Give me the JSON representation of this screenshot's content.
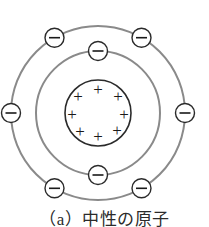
{
  "figure": {
    "caption": "（a）中性の原子",
    "colors": {
      "background": "#ffffff",
      "orbit_stroke": "#8a8a8a",
      "nucleus_stroke": "#1a1a1a",
      "electron_stroke": "#1a1a1a",
      "charge_symbol": "#1a1a1a",
      "caption_text": "#2b2b2b"
    },
    "geometry": {
      "center_x": 98,
      "center_y": 113,
      "outer_orbit_radius": 87,
      "inner_orbit_radius": 62,
      "nucleus_radius": 33,
      "electron_radius": 9.5
    },
    "nucleus": {
      "label": "nucleus",
      "charge_symbol": "+",
      "proton_count": 8,
      "protons": [
        {
          "x": 98,
          "y": 89
        },
        {
          "x": 78,
          "y": 96
        },
        {
          "x": 118,
          "y": 96
        },
        {
          "x": 72,
          "y": 114
        },
        {
          "x": 124,
          "y": 114
        },
        {
          "x": 80,
          "y": 131
        },
        {
          "x": 98,
          "y": 136
        },
        {
          "x": 117,
          "y": 130
        }
      ]
    },
    "shells": [
      {
        "name": "inner-shell",
        "radius": 62,
        "electron_symbol": "−",
        "electron_count": 2,
        "electron_angles_deg": [
          270,
          90
        ]
      },
      {
        "name": "outer-shell",
        "radius": 87,
        "electron_symbol": "−",
        "electron_count": 6,
        "electron_angles_deg": [
          240,
          300,
          180,
          0,
          120,
          60
        ]
      }
    ],
    "total_electrons": 8,
    "net_charge": "0"
  }
}
